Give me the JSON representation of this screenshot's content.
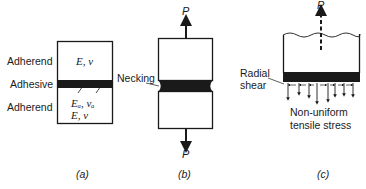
{
  "figure": {
    "panel_a": {
      "caption": "(a)",
      "labels": {
        "adherend_top": "Adherend",
        "adhesive": "Adhesive",
        "adherend_bottom": "Adherend"
      },
      "symbols": {
        "top": "E,  ν",
        "adhesive": "Eₐ,  νₐ",
        "bottom": "E,  ν"
      }
    },
    "panel_b": {
      "caption": "(b)",
      "necking_label": "Necking",
      "load_top": "P",
      "load_bottom": "P"
    },
    "panel_c": {
      "caption": "(c)",
      "load_top": "P",
      "radial_shear_line1": "Radial",
      "radial_shear_line2": "shear",
      "stress_line1": "Non-uniform",
      "stress_line2": "tensile stress"
    },
    "colors": {
      "ink": "#1a1a1a",
      "background": "#ffffff"
    }
  }
}
